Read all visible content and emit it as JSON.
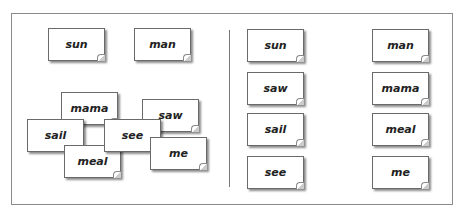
{
  "left_panel": {
    "cards": [
      {
        "word": "sun",
        "x": 48,
        "y": 28,
        "z": 1
      },
      {
        "word": "man",
        "x": 134,
        "y": 28,
        "z": 1
      },
      {
        "word": "mama",
        "x": 61,
        "y": 92,
        "z": 1
      },
      {
        "word": "sail",
        "x": 27,
        "y": 119,
        "z": 2
      },
      {
        "word": "meal",
        "x": 64,
        "y": 145,
        "z": 3
      },
      {
        "word": "saw",
        "x": 142,
        "y": 99,
        "z": 1
      },
      {
        "word": "see",
        "x": 104,
        "y": 119,
        "z": 4
      },
      {
        "word": "me",
        "x": 150,
        "y": 137,
        "z": 5
      }
    ]
  },
  "right_panel": {
    "cards": [
      {
        "word": "sun",
        "x": 247,
        "y": 29
      },
      {
        "word": "saw",
        "x": 247,
        "y": 72
      },
      {
        "word": "sail",
        "x": 247,
        "y": 113
      },
      {
        "word": "see",
        "x": 247,
        "y": 156
      },
      {
        "word": "man",
        "x": 372,
        "y": 29
      },
      {
        "word": "mama",
        "x": 372,
        "y": 72
      },
      {
        "word": "meal",
        "x": 372,
        "y": 113
      },
      {
        "word": "me",
        "x": 372,
        "y": 156
      }
    ]
  }
}
